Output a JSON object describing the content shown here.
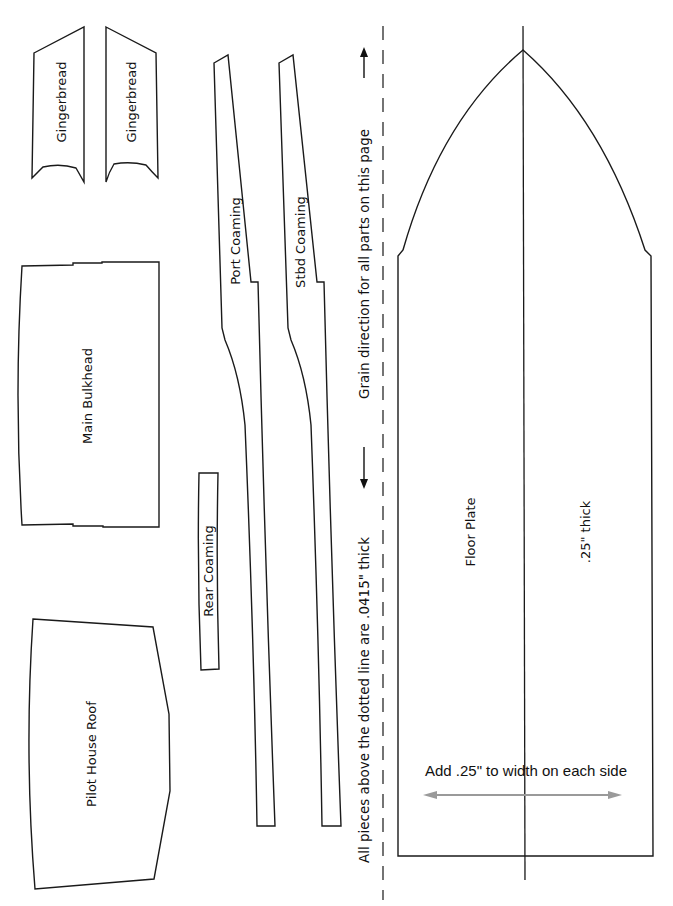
{
  "diagram": {
    "type": "boat-model-parts-cutting-template",
    "parts": [
      {
        "id": "gingerbread-1",
        "label": "Gingerbread"
      },
      {
        "id": "gingerbread-2",
        "label": "Gingerbread"
      },
      {
        "id": "main-bulkhead",
        "label": "Main Bulkhead"
      },
      {
        "id": "pilot-house-roof",
        "label": "Pilot House Roof"
      },
      {
        "id": "rear-coaming",
        "label": "Rear Coaming"
      },
      {
        "id": "port-coaming",
        "label": "Port Coaming"
      },
      {
        "id": "stbd-coaming",
        "label": "Stbd Coaming"
      },
      {
        "id": "floor-plate",
        "label": "Floor Plate",
        "thickness_label": ".25\" thick"
      }
    ],
    "notes": {
      "grain_direction": "Grain direction for all parts on this page",
      "thickness_above_line": "All pieces above the dotted line are .0415\" thick",
      "floor_plate_width": "Add .25\" to width on each side"
    },
    "colors": {
      "outline": "#1a1a1a",
      "background": "#ffffff",
      "width_arrow": "#9a9a9a"
    }
  }
}
